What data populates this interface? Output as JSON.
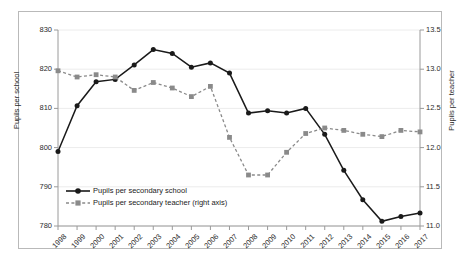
{
  "chart_data": {
    "type": "line",
    "title": "",
    "xlabel": "",
    "ylabel": "Pupils per school",
    "y2label": "Pupils per teacher",
    "ylim": [
      780,
      830
    ],
    "y2lim": [
      11.0,
      13.5
    ],
    "yticks": [
      "780",
      "790",
      "800",
      "810",
      "820",
      "830"
    ],
    "y2ticks": [
      "11.0",
      "11.5",
      "12.0",
      "12.5",
      "13.0",
      "13.5"
    ],
    "grid": true,
    "legend_position": "inside-bottom-left",
    "categories": [
      "1998",
      "1999",
      "2000",
      "2001",
      "2002",
      "2003",
      "2004",
      "2005",
      "2006",
      "2007",
      "2008",
      "2009",
      "2010",
      "2011",
      "2012",
      "2013",
      "2014",
      "2015",
      "2016",
      "2017"
    ],
    "series": [
      {
        "name": "Pupils per secondary school",
        "axis": "left",
        "color": "#1a1a1a",
        "style": "solid",
        "marker": "circle",
        "values": [
          799.0,
          810.7,
          816.8,
          817.4,
          821.1,
          825.0,
          824.0,
          820.5,
          821.6,
          819.0,
          808.8,
          809.4,
          808.8,
          810.0,
          803.4,
          794.2,
          786.7,
          781.2,
          782.4,
          783.3
        ]
      },
      {
        "name": "Pupils per secondary teacher (right axis)",
        "axis": "right",
        "color": "#8a8a8a",
        "style": "dashed",
        "marker": "square",
        "values": [
          12.98,
          12.9,
          12.93,
          12.9,
          12.73,
          12.83,
          12.76,
          12.65,
          12.78,
          12.13,
          11.65,
          11.65,
          11.94,
          12.18,
          12.25,
          12.22,
          12.17,
          12.14,
          12.22,
          12.2
        ]
      }
    ]
  },
  "legend": {
    "items": [
      {
        "label": "Pupils per secondary school"
      },
      {
        "label": "Pupils per secondary teacher (right axis)"
      }
    ]
  }
}
